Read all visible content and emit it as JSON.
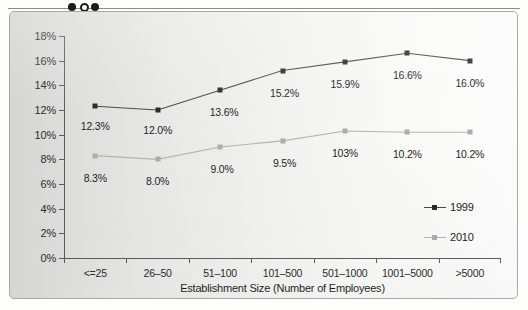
{
  "scan": {
    "fold_marks": [
      "solid-dot",
      "hollow-dot",
      "solid-dot"
    ]
  },
  "chart_data": {
    "type": "line",
    "title": "",
    "xlabel": "Establishment Size (Number of Employees)",
    "ylabel": "",
    "ylim": [
      0,
      18
    ],
    "ytick_labels": [
      "0%",
      "2%",
      "4%",
      "6%",
      "8%",
      "10%",
      "12%",
      "14%",
      "16%",
      "18%"
    ],
    "ytick_values": [
      0,
      2,
      4,
      6,
      8,
      10,
      12,
      14,
      16,
      18
    ],
    "grid": false,
    "legend_position": "right-inside",
    "categories": [
      "<=25",
      "26–50",
      "51–100",
      "101–500",
      "501–1000",
      "1001–5000",
      ">5000"
    ],
    "series": [
      {
        "name": "1999",
        "color": "#2a2a2a",
        "values": [
          12.3,
          12.0,
          13.6,
          15.2,
          15.9,
          16.6,
          16.0
        ],
        "labels": [
          "12.3%",
          "12.0%",
          "13.6%",
          "15.2%",
          "15.9%",
          "16.6%",
          "16.0%"
        ]
      },
      {
        "name": "2010",
        "color": "#adadad",
        "values": [
          8.3,
          8.0,
          9.0,
          9.5,
          10.3,
          10.2,
          10.2
        ],
        "labels": [
          "8.3%",
          "8.0%",
          "9.0%",
          "9.5%",
          "103%",
          "10.2%",
          "10.2%"
        ]
      }
    ]
  },
  "legend": {
    "items": [
      {
        "label": "1999"
      },
      {
        "label": "2010"
      }
    ]
  }
}
